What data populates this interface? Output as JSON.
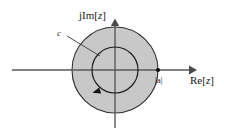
{
  "figure": {
    "background_color": "#ffffff",
    "width": 225,
    "height": 134
  },
  "axes": {
    "real": {
      "label": "Re[",
      "label_var": "z",
      "label_close": "]",
      "name": "Re[z]",
      "orientation": "horizontal",
      "arrow": "right-arrow-icon",
      "color": "#555555",
      "x_start": 12,
      "x_end": 196,
      "y": 70
    },
    "imaginary": {
      "label": "jIm[",
      "label_var": "z",
      "label_close": "]",
      "name": "jIm[z]",
      "orientation": "vertical",
      "arrow": "up-arrow-icon",
      "color": "#555555",
      "y_start": 128,
      "y_end": 20,
      "x": 115
    },
    "origin": {
      "x": 115,
      "y": 70
    }
  },
  "shaded_region": {
    "name": "region-of-convergence",
    "shape": "disk",
    "center": {
      "x": 115,
      "y": 70
    },
    "radius": 43,
    "fill_color": "#c8c8c8",
    "stroke_color": "#2e2e2e"
  },
  "contour": {
    "name": "closed-contour-c",
    "label": "c",
    "shape": "circle",
    "center": {
      "x": 115,
      "y": 70
    },
    "radius": 23,
    "stroke_color": "#1a1a1a",
    "direction": "clockwise",
    "arrow_marker": "clockwise-arrowhead-icon",
    "label_position": {
      "x": 59,
      "y": 34
    },
    "leader_line": {
      "x1": 66,
      "y1": 36,
      "x2": 99,
      "y2": 55
    }
  },
  "markers": [
    {
      "name": "pole-magnitude-a",
      "label": "|a|",
      "point": {
        "x": 158,
        "y": 70
      },
      "marker": "dot-marker-icon",
      "color": "#111111",
      "label_position": {
        "x": 156,
        "y": 82
      }
    }
  ]
}
